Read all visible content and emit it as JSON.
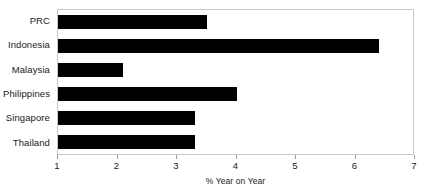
{
  "chart_data": {
    "type": "bar",
    "orientation": "horizontal",
    "title": "",
    "subtitle": "",
    "xlabel": "% Year on Year",
    "ylabel": "",
    "categories": [
      "PRC",
      "Indonesia",
      "Malaysia",
      "Philippines",
      "Singapore",
      "Thailand"
    ],
    "values": [
      3.5,
      6.4,
      2.1,
      4.0,
      3.3,
      3.3
    ],
    "series": [
      {
        "name": "",
        "values": [
          3.5,
          6.4,
          2.1,
          4.0,
          3.3,
          3.3
        ]
      }
    ],
    "xlim": [
      1,
      7
    ],
    "xticks": [
      1,
      2,
      3,
      4,
      5,
      6,
      7
    ],
    "xtick_labels": [
      "1",
      "2",
      "3",
      "4",
      "5",
      "6",
      "7"
    ],
    "grid": false,
    "legend": false,
    "legend_position": "none",
    "bar_color": "#000000",
    "plot_border_color": "#c8c8c8",
    "background_color": "#ffffff",
    "annotations": []
  }
}
